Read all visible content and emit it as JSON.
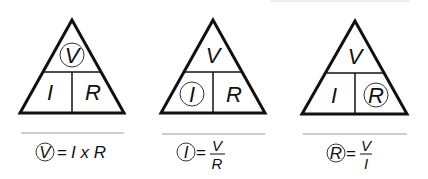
{
  "diagram": {
    "colors": {
      "stroke": "#111111",
      "separator": "#9a9a9a",
      "top_edge": "#eeeeee"
    },
    "triangles": [
      {
        "id": "solve-v",
        "top": "V",
        "bottom_left": "I",
        "bottom_right": "R",
        "circled": "V",
        "formula": {
          "lhs": "V",
          "eq": "=",
          "rhs": "I x R"
        }
      },
      {
        "id": "solve-i",
        "top": "V",
        "bottom_left": "I",
        "bottom_right": "R",
        "circled": "I",
        "formula": {
          "lhs": "I",
          "eq": "=",
          "numerator": "V",
          "denominator": "R"
        }
      },
      {
        "id": "solve-r",
        "top": "V",
        "bottom_left": "I",
        "bottom_right": "R",
        "circled": "R",
        "formula": {
          "lhs": "R",
          "eq": "=",
          "numerator": "V",
          "denominator": "I"
        }
      }
    ]
  }
}
